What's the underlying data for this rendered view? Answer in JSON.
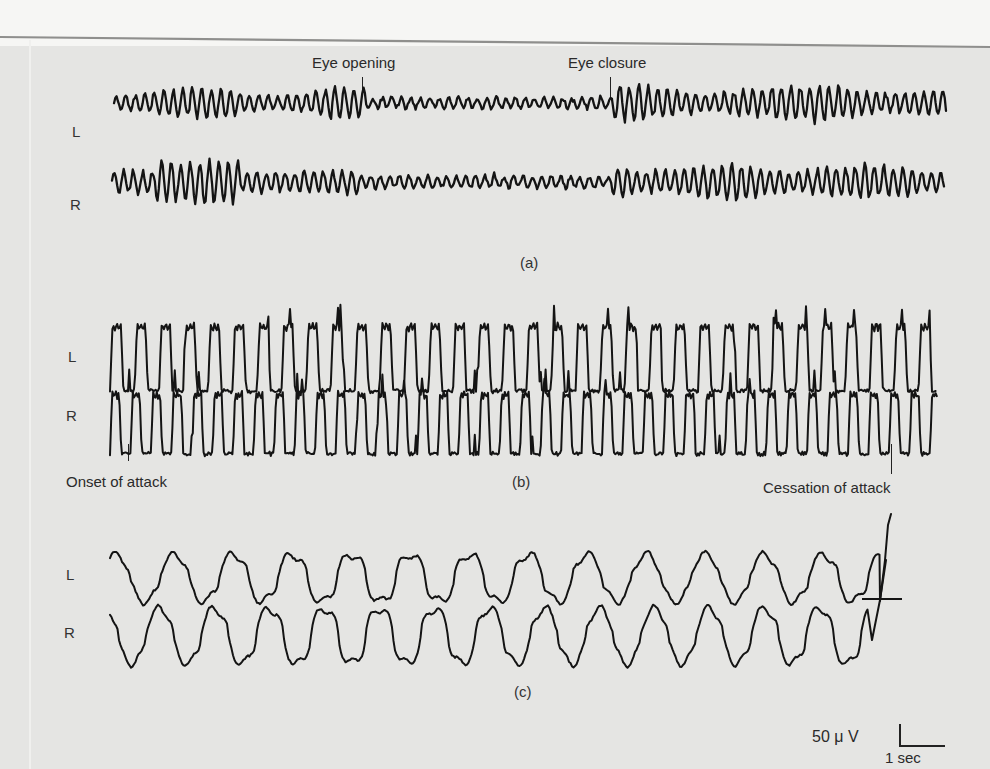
{
  "figure": {
    "background_color": "#e5e5e3",
    "trace_color": "#141414",
    "panels": [
      {
        "id": "a",
        "caption": "(a)",
        "channels": [
          {
            "name": "L",
            "label": "L"
          },
          {
            "name": "R",
            "label": "R"
          }
        ],
        "annotations": [
          {
            "text": "Eye opening",
            "marker": "tick"
          },
          {
            "text": "Eye closure",
            "marker": "tick"
          }
        ]
      },
      {
        "id": "b",
        "caption": "(b)",
        "channels": [
          {
            "name": "L",
            "label": "L"
          },
          {
            "name": "R",
            "label": "R"
          }
        ],
        "annotations": [
          {
            "text": "Onset of attack",
            "marker": "tick"
          },
          {
            "text": "Cessation of attack",
            "marker": "tick"
          }
        ]
      },
      {
        "id": "c",
        "caption": "(c)",
        "channels": [
          {
            "name": "L",
            "label": "L"
          },
          {
            "name": "R",
            "label": "R"
          }
        ],
        "annotations": []
      }
    ],
    "scale_bar": {
      "amplitude_label": "50 μ V",
      "time_label": "1 sec"
    }
  }
}
